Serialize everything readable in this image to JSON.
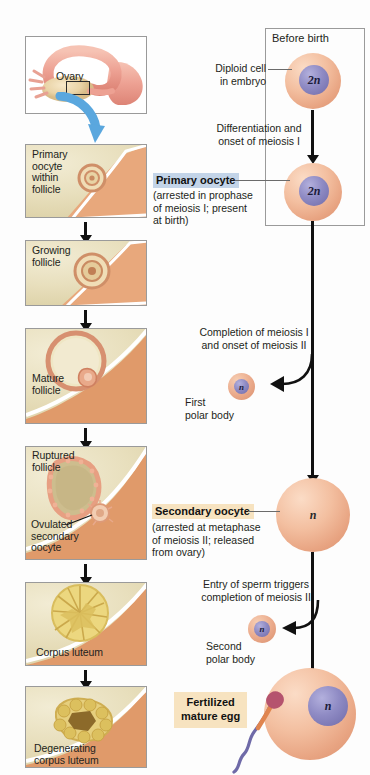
{
  "figure": {
    "left_column": {
      "panels": [
        {
          "id": "ovary-overview",
          "label": "Ovary"
        },
        {
          "id": "primary-oocyte-follicle",
          "label": "Primary\noocyte\nwithin\nfollicle",
          "lines": [
            "Primary",
            "oocyte",
            "within",
            "follicle"
          ]
        },
        {
          "id": "growing-follicle",
          "lines": [
            "Growing",
            "follicle"
          ]
        },
        {
          "id": "mature-follicle",
          "lines": [
            "Mature",
            "follicle"
          ]
        },
        {
          "id": "ruptured-follicle",
          "lines": [
            "Ruptured",
            "follicle"
          ],
          "secondary_label_lines": [
            "Ovulated",
            "secondary",
            "oocyte"
          ]
        },
        {
          "id": "corpus-luteum",
          "lines": [
            "Corpus luteum"
          ]
        },
        {
          "id": "degenerating-corpus-luteum",
          "lines": [
            "Degenerating",
            "corpus  luteum"
          ]
        }
      ]
    },
    "right_column": {
      "before_birth_box_title": "Before birth",
      "diploid_cell_label_lines": [
        "Diploid cell",
        "in embryo"
      ],
      "cells": {
        "diploid_ploidy": "2n",
        "primary_oocyte_ploidy": "2n",
        "first_polar_body_ploidy": "n",
        "secondary_oocyte_ploidy": "n",
        "second_polar_body_ploidy": "n",
        "fertilized_egg_ploidy": "n"
      },
      "step_texts": [
        {
          "id": "differentiation",
          "lines": [
            "Differentiation and",
            "onset of meiosis I"
          ]
        },
        {
          "id": "completion-meiosis-1",
          "lines": [
            "Completion of meiosis I",
            "and onset of meiosis II"
          ]
        },
        {
          "id": "sperm-entry",
          "lines": [
            "Entry of sperm triggers",
            "completion of meiosis II"
          ]
        }
      ],
      "callouts": [
        {
          "id": "primary-oocyte",
          "title": "Primary oocyte",
          "highlight": "#c3d4e8",
          "detail_lines": [
            "(arrested in prophase",
            "of meiosis I; present",
            "at birth)"
          ]
        },
        {
          "id": "secondary-oocyte",
          "title": "Secondary oocyte",
          "highlight": "#f7e3c0",
          "detail_lines": [
            "(arrested at metaphase",
            "of meiosis II; released",
            "from ovary)"
          ]
        },
        {
          "id": "fertilized-mature-egg",
          "title_lines": [
            "Fertilized",
            "mature egg"
          ],
          "highlight": "#f7e3c0"
        }
      ],
      "polar_bodies": [
        {
          "id": "first-polar-body",
          "lines": [
            "First",
            "polar body"
          ]
        },
        {
          "id": "second-polar-body",
          "lines": [
            "Second",
            "polar body"
          ]
        }
      ]
    },
    "colors": {
      "cell_cytoplasm": "#f3bfa0",
      "nucleus": "#8f8bc4",
      "tissue": "#e8dfbd",
      "stroma": "#e5a778",
      "blue_arrow": "#5aa7de",
      "corpus_luteum": "#e8d37a",
      "sperm": "#6f6aa8",
      "arrow_black": "#111111"
    }
  }
}
